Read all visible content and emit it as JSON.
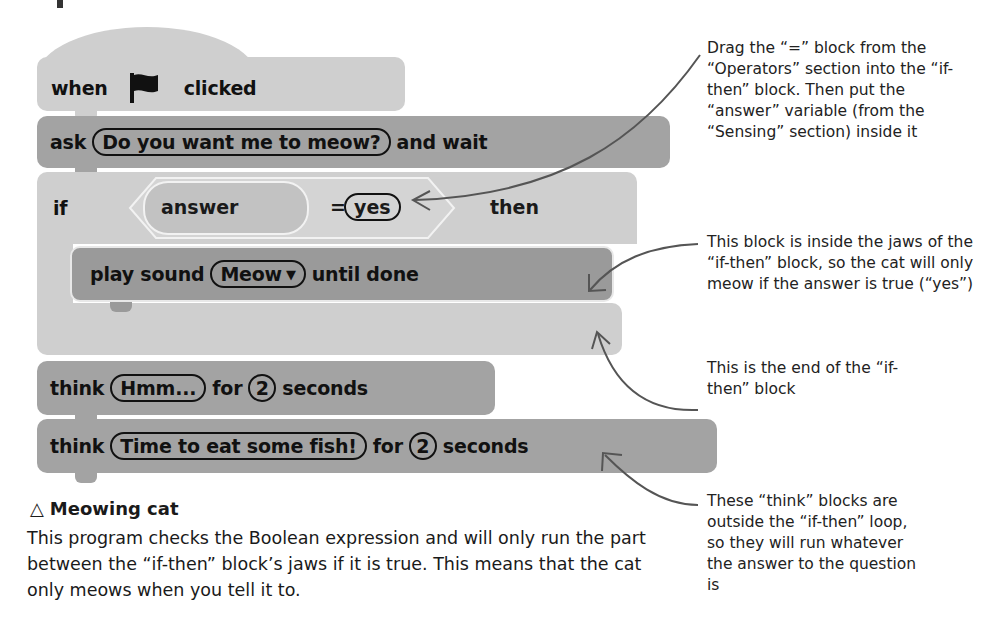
{
  "script": {
    "hat_block": {
      "prefix": "when",
      "icon": "green-flag-icon",
      "suffix": "clicked"
    },
    "ask_block": {
      "prefix": "ask",
      "input": "Do you want me to meow?",
      "suffix": "and wait"
    },
    "if_block": {
      "prefix": "if",
      "condition": {
        "left": "answer",
        "operator": "=",
        "right": "yes"
      },
      "suffix": "then"
    },
    "play_sound_block": {
      "prefix": "play sound",
      "dropdown": "Meow",
      "dropdown_icon": "▼",
      "suffix": "until done"
    },
    "think_block_1": {
      "prefix": "think",
      "input": "Hmm...",
      "mid": "for",
      "seconds": "2",
      "suffix": "seconds"
    },
    "think_block_2": {
      "prefix": "think",
      "input": "Time to eat some fish!",
      "mid": "for",
      "seconds": "2",
      "suffix": "seconds"
    }
  },
  "annotations": [
    {
      "text": "Drag the “=” block from the “Operators” section into the “if-then” block. Then put the “answer” variable (from the “Sensing” section) inside it"
    },
    {
      "text": "This block is inside the jaws of the “if-then” block, so the cat will only meow if the answer is true (“yes”)"
    },
    {
      "text": "This is the end of the “if-then” block"
    },
    {
      "text": "These “think” blocks are outside the “if-then” loop, so they will run whatever the answer to the question is"
    }
  ],
  "caption": {
    "icon": "△",
    "title": "Meowing cat",
    "body": "This program checks the Boolean expression and will only run the part between the “if-then” block’s jaws if it is true. This means that the cat only meows when you tell it to."
  }
}
